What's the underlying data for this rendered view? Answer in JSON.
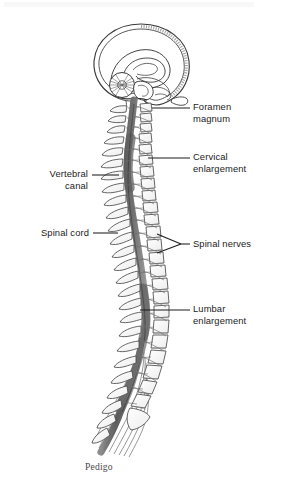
{
  "figure": {
    "caption": "Pedigo",
    "background_color": "#ffffff",
    "ink_color": "#3a3a3a",
    "cord_color": "#6e6e6e",
    "leader_color": "#1c1c1c"
  },
  "labels": {
    "right": [
      {
        "name": "foramen-magnum",
        "text": "Foramen\nmagnum",
        "text_x": 193,
        "text_y": 102,
        "leader": {
          "x1": 152,
          "y1": 108,
          "x2": 190,
          "y2": 108
        }
      },
      {
        "name": "cervical-enlargement",
        "text": "Cervical\nenlargement",
        "text_x": 193,
        "text_y": 152,
        "leader": {
          "x1": 148,
          "y1": 158,
          "x2": 190,
          "y2": 158
        }
      },
      {
        "name": "spinal-nerves",
        "text": "Spinal nerves",
        "text_x": 193,
        "text_y": 238,
        "leader": {
          "x1": 181,
          "y1": 244,
          "x2": 190,
          "y2": 244
        },
        "fork": [
          {
            "x1": 157,
            "y1": 234,
            "x2": 181,
            "y2": 244
          },
          {
            "x1": 157,
            "y1": 253,
            "x2": 181,
            "y2": 244
          }
        ]
      },
      {
        "name": "lumbar-enlargement",
        "text": "Lumbar\nenlargement",
        "text_x": 193,
        "text_y": 304,
        "leader": {
          "x1": 140,
          "y1": 310,
          "x2": 190,
          "y2": 310
        }
      }
    ],
    "left": [
      {
        "name": "vertebral-canal",
        "text": "Vertebral\ncanal",
        "text_right": 196,
        "text_y": 169,
        "leader": {
          "x1": 92,
          "y1": 175,
          "x2": 119,
          "y2": 175
        }
      },
      {
        "name": "spinal-cord",
        "text": "Spinal cord",
        "text_right": 196,
        "text_y": 227,
        "leader": {
          "x1": 93,
          "y1": 233,
          "x2": 118,
          "y2": 233
        }
      }
    ]
  },
  "anatomy": {
    "skull": {
      "label": "skull-cranium",
      "cx": 140,
      "cy": 63,
      "rx": 47,
      "ry": 39
    },
    "brain_parts": [
      "cerebrum",
      "corpus-callosum",
      "cerebellum",
      "brainstem",
      "medulla"
    ],
    "vertebrae_count": 26,
    "regions": [
      {
        "name": "cervical",
        "vertebrae": 7
      },
      {
        "name": "thoracic",
        "vertebrae": 12
      },
      {
        "name": "lumbar",
        "vertebrae": 5
      },
      {
        "name": "sacral",
        "vertebrae": 1
      }
    ],
    "cauda_equina": {
      "label": "cauda-equina",
      "filaments": 7
    }
  }
}
